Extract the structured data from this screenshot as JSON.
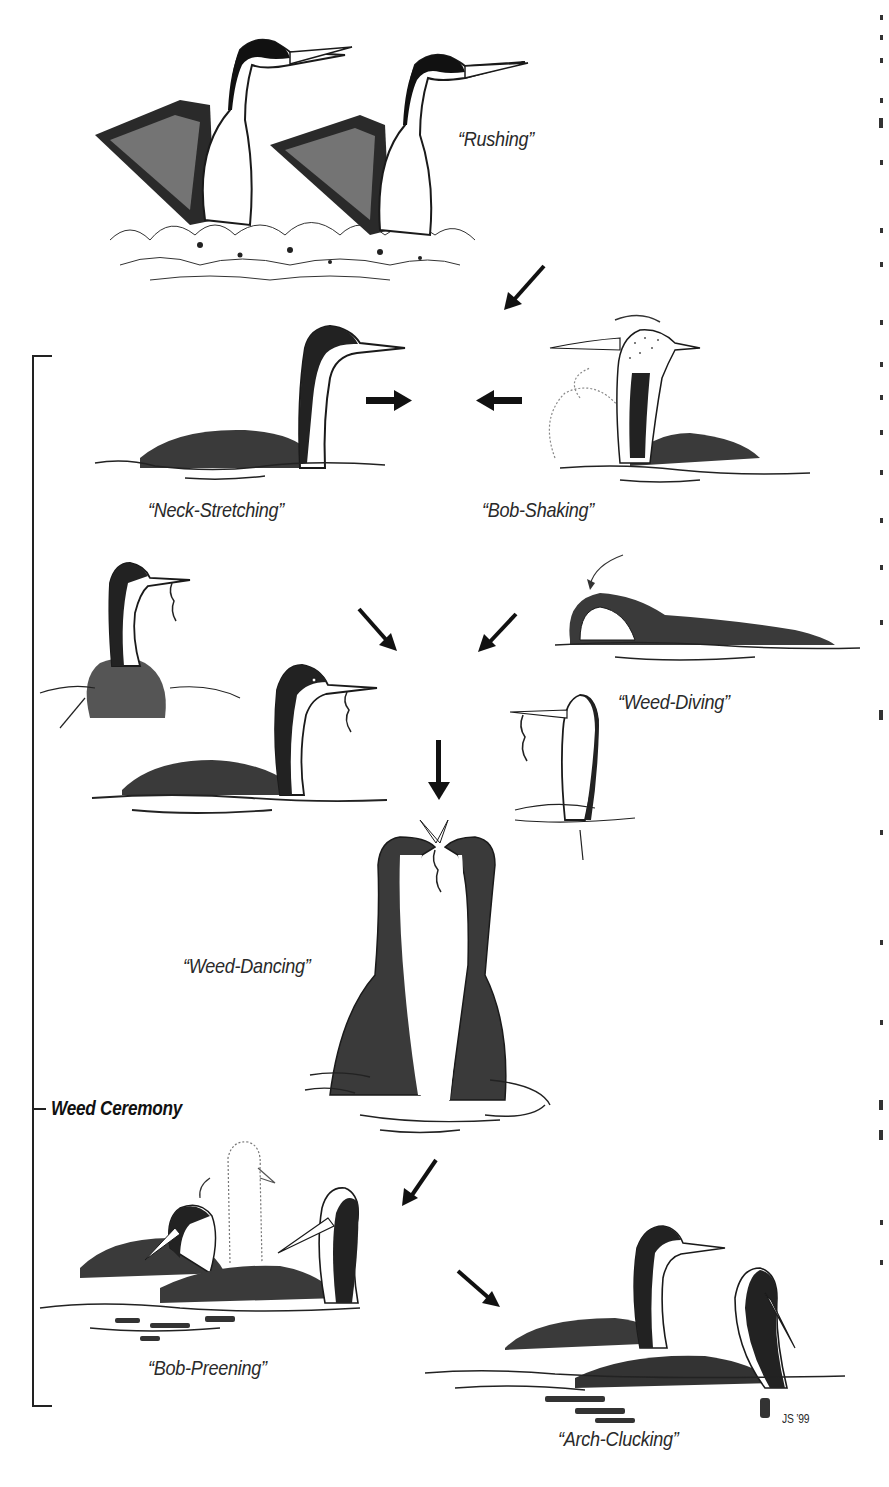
{
  "figure": {
    "title": "Weed Ceremony",
    "behaviors": [
      {
        "id": "rushing",
        "label": "“Rushing”"
      },
      {
        "id": "neck-stretching",
        "label": "“Neck-Stretching”"
      },
      {
        "id": "bob-shaking",
        "label": "“Bob-Shaking”"
      },
      {
        "id": "weed-diving",
        "label": "“Weed-Diving”"
      },
      {
        "id": "weed-dancing",
        "label": "“Weed-Dancing”"
      },
      {
        "id": "bob-preening",
        "label": "“Bob-Preening”"
      },
      {
        "id": "arch-clucking",
        "label": "“Arch-Clucking”"
      }
    ],
    "group_label": "Weed Ceremony",
    "signature": "JS ’99"
  },
  "colors": {
    "ink": "#1a1a1a",
    "paper": "#ffffff",
    "label": "#2a2a2a"
  }
}
